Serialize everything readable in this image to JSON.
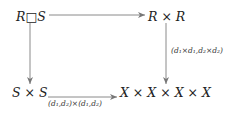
{
  "diagram": {
    "type": "commutative-diagram",
    "nodes": {
      "top_left": {
        "text": "R□S"
      },
      "top_right": {
        "text": "R × R"
      },
      "bottom_left": {
        "text": "S × S"
      },
      "bottom_right": {
        "text": "X × X × X × X"
      }
    },
    "arrows": {
      "top": {
        "from": "R□S",
        "to": "R × R",
        "label": ""
      },
      "left": {
        "from": "R□S",
        "to": "S × S",
        "label": ""
      },
      "right": {
        "from": "R × R",
        "to": "X × X × X × X",
        "label": "(d₁×d₁,d₂×d₂)"
      },
      "bottom": {
        "from": "S × S",
        "to": "X × X × X × X",
        "label": "(d₁,d₂)×(d₁,d₂)"
      }
    },
    "colors": {
      "arrow": "#8a8a8a",
      "text": "#222222"
    }
  }
}
